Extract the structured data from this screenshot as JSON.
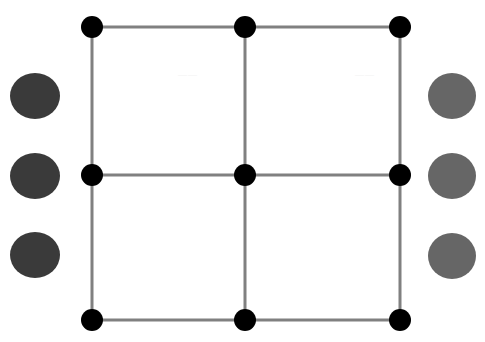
{
  "figure": {
    "canvas": {
      "width": 485,
      "height": 342,
      "background_color": "#ffffff"
    },
    "grid": {
      "label": "grid-lattice",
      "node_color": "#000000",
      "node_radius": 11,
      "edge_color": "#808080",
      "edge_width": 3,
      "columns_x": [
        92,
        245,
        400
      ],
      "rows_y": [
        27,
        175,
        320
      ],
      "nodes": [
        {
          "name": "node-top-left",
          "x": 92,
          "y": 27,
          "row": 0,
          "col": 0
        },
        {
          "name": "node-top-center",
          "x": 245,
          "y": 27,
          "row": 0,
          "col": 1
        },
        {
          "name": "node-top-right",
          "x": 400,
          "y": 27,
          "row": 0,
          "col": 2
        },
        {
          "name": "node-middle-left",
          "x": 92,
          "y": 175,
          "row": 1,
          "col": 0
        },
        {
          "name": "node-middle-center",
          "x": 245,
          "y": 175,
          "row": 1,
          "col": 1
        },
        {
          "name": "node-middle-right",
          "x": 400,
          "y": 175,
          "row": 1,
          "col": 2
        },
        {
          "name": "node-bottom-left",
          "x": 92,
          "y": 320,
          "row": 2,
          "col": 0
        },
        {
          "name": "node-bottom-center",
          "x": 245,
          "y": 320,
          "row": 2,
          "col": 1
        },
        {
          "name": "node-bottom-right",
          "x": 400,
          "y": 320,
          "row": 2,
          "col": 2
        }
      ],
      "edges": [
        {
          "name": "edge-top-row",
          "x1": 92,
          "y1": 27,
          "x2": 400,
          "y2": 27
        },
        {
          "name": "edge-middle-row",
          "x1": 92,
          "y1": 175,
          "x2": 400,
          "y2": 175
        },
        {
          "name": "edge-bottom-row",
          "x1": 92,
          "y1": 320,
          "x2": 400,
          "y2": 320
        },
        {
          "name": "edge-left-column",
          "x1": 92,
          "y1": 27,
          "x2": 92,
          "y2": 320
        },
        {
          "name": "edge-center-column",
          "x1": 245,
          "y1": 27,
          "x2": 245,
          "y2": 320
        },
        {
          "name": "edge-right-column",
          "x1": 400,
          "y1": 27,
          "x2": 400,
          "y2": 320
        }
      ],
      "cell_count": 4
    },
    "left_circles": {
      "label": "left-circle-column",
      "fill_color": "#3a3a3a",
      "count": 3,
      "items": [
        {
          "name": "left-circle-1",
          "cx": 35,
          "cy": 96,
          "rx": 25,
          "ry": 23
        },
        {
          "name": "left-circle-2",
          "cx": 35,
          "cy": 176,
          "rx": 25,
          "ry": 23
        },
        {
          "name": "left-circle-3",
          "cx": 35,
          "cy": 255,
          "rx": 25,
          "ry": 23
        }
      ]
    },
    "right_circles": {
      "label": "right-circle-column",
      "fill_color": "#666666",
      "count": 3,
      "items": [
        {
          "name": "right-circle-1",
          "cx": 452,
          "cy": 96,
          "rx": 24,
          "ry": 23
        },
        {
          "name": "right-circle-2",
          "cx": 452,
          "cy": 176,
          "rx": 24,
          "ry": 23
        },
        {
          "name": "right-circle-3",
          "cx": 452,
          "cy": 256,
          "rx": 24,
          "ry": 23
        }
      ]
    },
    "artifacts": [
      {
        "name": "scan-artifact-upper-left-cell",
        "text": "——",
        "x": 178,
        "y": 70
      },
      {
        "name": "scan-artifact-upper-right-cell",
        "text": "——",
        "x": 355,
        "y": 70
      }
    ]
  }
}
